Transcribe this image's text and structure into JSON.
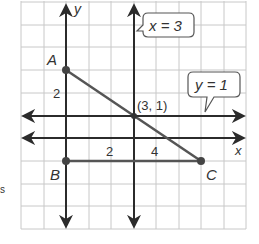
{
  "graph": {
    "axes": {
      "x_label": "x",
      "y_label": "y",
      "x_tick_labels": [
        {
          "value": 2,
          "text": "2"
        },
        {
          "value": 4,
          "text": "4"
        }
      ],
      "y_tick_labels": [
        {
          "value": 2,
          "text": "2"
        }
      ]
    },
    "points": {
      "A": {
        "label": "A",
        "x": 0,
        "y": 3
      },
      "B": {
        "label": "B",
        "x": 0,
        "y": -1
      },
      "C": {
        "label": "C",
        "x": 6,
        "y": -1
      },
      "intersection": {
        "label": "(3, 1)",
        "x": 3,
        "y": 1
      }
    },
    "lines": {
      "vertical": {
        "label": "x = 3"
      },
      "horizontal": {
        "label": "y = 1"
      }
    },
    "segments": [
      {
        "from": "A",
        "to": "C"
      },
      {
        "from": "B",
        "to": "C"
      }
    ],
    "colors": {
      "grid": "#c8c8c8",
      "axis": "#2b2b2b",
      "segment": "#555555",
      "text": "#333333"
    }
  },
  "side_mark": "s"
}
